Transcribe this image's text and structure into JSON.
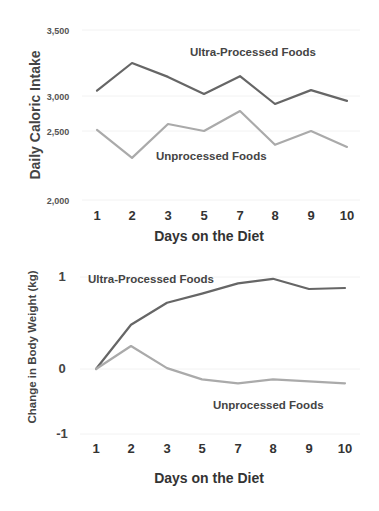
{
  "chart_data": [
    {
      "type": "line",
      "title": "",
      "xlabel": "Days on the Diet",
      "ylabel": "Daily Caloric Intake",
      "categories": [
        "1",
        "2",
        "3",
        "5",
        "7",
        "8",
        "9",
        "10"
      ],
      "yticks": [
        {
          "value": 3500,
          "label": "3,500"
        },
        {
          "value": 3000,
          "label": "3,000"
        },
        {
          "value": 2500,
          "label": "2,500"
        },
        {
          "value": 2000,
          "label": "2,000"
        }
      ],
      "ylim": [
        2000,
        3500
      ],
      "grid": true,
      "series": [
        {
          "name": "Ultra-Processed Foods",
          "color": "#666666",
          "values": [
            3040,
            3250,
            3145,
            3015,
            3150,
            2885,
            3045,
            2930
          ]
        },
        {
          "name": "Unprocessed Foods",
          "color": "#aaaaaa",
          "values": [
            2515,
            2305,
            2600,
            2500,
            2785,
            2400,
            2500,
            2385
          ]
        }
      ]
    },
    {
      "type": "line",
      "title": "",
      "xlabel": "Days on the Diet",
      "ylabel": "Change in Body Weight (kg)",
      "categories": [
        "1",
        "2",
        "3",
        "5",
        "7",
        "8",
        "9",
        "10"
      ],
      "yticks": [
        {
          "value": 1,
          "label": "1"
        },
        {
          "value": 0,
          "label": "0"
        },
        {
          "value": -1,
          "label": "-1"
        }
      ],
      "ylim": [
        -1,
        1
      ],
      "grid": true,
      "series": [
        {
          "name": "Ultra-Processed Foods",
          "color": "#666666",
          "values": [
            0,
            0.48,
            0.72,
            0.82,
            0.93,
            0.98,
            0.87,
            0.88
          ]
        },
        {
          "name": "Unprocessed Foods",
          "color": "#aaaaaa",
          "values": [
            0,
            0.25,
            0.01,
            -0.16,
            -0.22,
            -0.16,
            -0.19,
            -0.22
          ]
        }
      ]
    }
  ]
}
